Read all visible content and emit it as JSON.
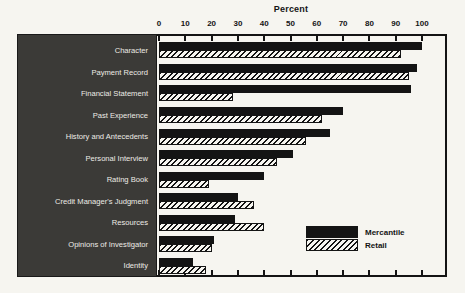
{
  "colors": {
    "paper": "#f6f5f0",
    "panel": "#3b3a37",
    "ink": "#141414",
    "label_text": "#edebe6"
  },
  "chart_data": {
    "type": "bar",
    "orientation": "horizontal",
    "xlabel": "Percent",
    "xlim": [
      0,
      100
    ],
    "ticks": [
      0,
      10,
      20,
      30,
      40,
      50,
      60,
      70,
      80,
      90,
      100
    ],
    "grid": false,
    "legend_position": "inside-lower-right",
    "categories": [
      "Character",
      "Payment Record",
      "Financial Statement",
      "Past Experience",
      "History and Antecedents",
      "Personal Interview",
      "Rating Book",
      "Credit Manager's Judgment",
      "Resources",
      "Opinions of Investigator",
      "Identity"
    ],
    "series": [
      {
        "name": "Mercantile",
        "style": "solid-black",
        "values": [
          100,
          98,
          96,
          70,
          65,
          51,
          40,
          30,
          29,
          21,
          13
        ]
      },
      {
        "name": "Retail",
        "style": "diagonal-hatch",
        "values": [
          92,
          95,
          28,
          62,
          56,
          45,
          19,
          36,
          40,
          20,
          18
        ]
      }
    ]
  }
}
